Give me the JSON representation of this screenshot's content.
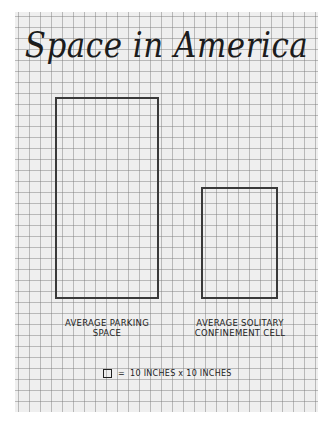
{
  "title": "Space in America",
  "shapes": [
    {
      "name": "parking-space",
      "label_line1": "AVERAGE PARKING",
      "label_line2": "SPACE",
      "width_cells": 9.5,
      "height_cells": 18.5
    },
    {
      "name": "solitary-cell",
      "label_line1": "AVERAGE SOLITARY",
      "label_line2": "CONFINEMENT CELL",
      "width_cells": 7,
      "height_cells": 10
    }
  ],
  "legend": {
    "equals": "=",
    "text": "10 INCHES x 10 INCHES"
  },
  "colors": {
    "paper": "#efefef",
    "grid": "#8a8a8a",
    "ink": "#2a2a2a"
  }
}
